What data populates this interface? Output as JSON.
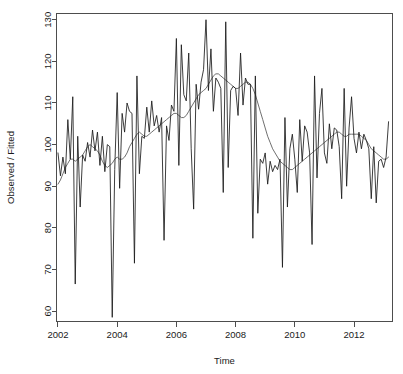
{
  "chart_data": {
    "type": "line",
    "title": "",
    "xlabel": "Time",
    "ylabel": "Observed / Fitted",
    "xlim": [
      2001.95,
      2013.3
    ],
    "ylim": [
      57.5,
      131.5
    ],
    "grid": false,
    "legend": "none",
    "xticks": [
      2002,
      2004,
      2006,
      2008,
      2010,
      2012
    ],
    "xticklabels": [
      "2002",
      "2004",
      "2006",
      "2008",
      "2010",
      "2012"
    ],
    "yticks": [
      60,
      70,
      80,
      90,
      100,
      110,
      120,
      130
    ],
    "yticklabels": [
      "60",
      "70",
      "80",
      "90",
      "100",
      "110",
      "120",
      "130"
    ],
    "x": [
      2002.0,
      2002.083,
      2002.167,
      2002.25,
      2002.333,
      2002.417,
      2002.5,
      2002.583,
      2002.667,
      2002.75,
      2002.833,
      2002.917,
      2003.0,
      2003.083,
      2003.167,
      2003.25,
      2003.333,
      2003.417,
      2003.5,
      2003.583,
      2003.667,
      2003.75,
      2003.833,
      2003.917,
      2004.0,
      2004.083,
      2004.167,
      2004.25,
      2004.333,
      2004.417,
      2004.5,
      2004.583,
      2004.667,
      2004.75,
      2004.833,
      2004.917,
      2005.0,
      2005.083,
      2005.167,
      2005.25,
      2005.333,
      2005.417,
      2005.5,
      2005.583,
      2005.667,
      2005.75,
      2005.833,
      2005.917,
      2006.0,
      2006.083,
      2006.167,
      2006.25,
      2006.333,
      2006.417,
      2006.5,
      2006.583,
      2006.667,
      2006.75,
      2006.833,
      2006.917,
      2007.0,
      2007.083,
      2007.167,
      2007.25,
      2007.333,
      2007.417,
      2007.5,
      2007.583,
      2007.667,
      2007.75,
      2007.833,
      2007.917,
      2008.0,
      2008.083,
      2008.167,
      2008.25,
      2008.333,
      2008.417,
      2008.5,
      2008.583,
      2008.667,
      2008.75,
      2008.833,
      2008.917,
      2009.0,
      2009.083,
      2009.167,
      2009.25,
      2009.333,
      2009.417,
      2009.5,
      2009.583,
      2009.667,
      2009.75,
      2009.833,
      2009.917,
      2010.0,
      2010.083,
      2010.167,
      2010.25,
      2010.333,
      2010.417,
      2010.5,
      2010.583,
      2010.667,
      2010.75,
      2010.833,
      2010.917,
      2011.0,
      2011.083,
      2011.167,
      2011.25,
      2011.333,
      2011.417,
      2011.5,
      2011.583,
      2011.667,
      2011.75,
      2011.833,
      2011.917,
      2012.0,
      2012.083,
      2012.167,
      2012.25,
      2012.333,
      2012.417,
      2012.5,
      2012.583,
      2012.667,
      2012.75,
      2012.833,
      2012.917,
      2013.0,
      2013.083,
      2013.167
    ],
    "series": [
      {
        "name": "Observed",
        "color": "#1a1a1a",
        "values": [
          98.0,
          92.5,
          97.0,
          93.0,
          106.0,
          96.5,
          111.5,
          66.5,
          102.0,
          85.0,
          97.5,
          96.0,
          100.5,
          97.0,
          103.5,
          98.5,
          103.0,
          95.0,
          102.0,
          93.5,
          100.0,
          99.5,
          58.5,
          94.0,
          112.5,
          89.5,
          107.5,
          103.0,
          110.0,
          108.0,
          107.5,
          71.5,
          116.5,
          93.0,
          102.0,
          101.5,
          109.0,
          103.0,
          110.5,
          104.5,
          107.0,
          103.0,
          106.5,
          77.0,
          104.5,
          101.0,
          109.5,
          108.0,
          125.5,
          95.0,
          124.0,
          112.0,
          110.5,
          122.0,
          99.0,
          84.5,
          114.5,
          108.5,
          115.0,
          118.0,
          130.0,
          113.0,
          123.0,
          108.0,
          116.0,
          115.0,
          113.5,
          88.5,
          129.5,
          94.5,
          113.0,
          114.0,
          113.5,
          107.0,
          122.0,
          109.5,
          116.0,
          114.5,
          114.5,
          77.5,
          116.5,
          83.5,
          96.5,
          95.5,
          98.0,
          90.5,
          96.0,
          93.5,
          95.0,
          94.0,
          96.5,
          70.5,
          106.5,
          85.0,
          99.0,
          102.5,
          96.5,
          88.5,
          106.0,
          96.0,
          104.5,
          103.0,
          98.0,
          76.0,
          116.5,
          92.0,
          107.5,
          113.5,
          98.0,
          95.5,
          105.0,
          99.0,
          104.0,
          103.5,
          99.5,
          87.0,
          113.5,
          90.0,
          104.0,
          111.5,
          101.5,
          98.0,
          103.0,
          99.0,
          102.5,
          101.0,
          99.0,
          87.0,
          99.5,
          86.0,
          96.0,
          96.5,
          94.5,
          97.0,
          105.5
        ]
      },
      {
        "name": "Fitted",
        "color": "#555555",
        "values": [
          90.5,
          91.5,
          93.0,
          94.5,
          95.5,
          96.5,
          96.5,
          96.0,
          96.5,
          97.0,
          97.5,
          98.5,
          99.5,
          100.0,
          99.5,
          99.0,
          98.5,
          97.5,
          96.0,
          95.0,
          94.5,
          95.0,
          95.5,
          96.5,
          97.0,
          96.5,
          96.5,
          97.0,
          98.0,
          99.5,
          100.5,
          101.5,
          102.5,
          103.0,
          102.5,
          102.0,
          102.0,
          102.5,
          103.0,
          103.5,
          104.0,
          104.5,
          105.0,
          105.5,
          106.0,
          106.5,
          107.0,
          107.5,
          107.5,
          107.0,
          106.5,
          106.5,
          107.0,
          108.0,
          109.0,
          110.0,
          111.0,
          112.0,
          112.5,
          113.0,
          113.5,
          114.5,
          115.5,
          116.5,
          117.0,
          117.0,
          116.5,
          116.0,
          115.5,
          115.0,
          114.5,
          114.0,
          113.5,
          113.5,
          114.0,
          114.5,
          115.0,
          115.0,
          114.5,
          113.5,
          112.0,
          110.0,
          108.0,
          106.0,
          104.0,
          102.0,
          100.5,
          99.0,
          98.0,
          97.0,
          96.0,
          95.5,
          95.0,
          94.5,
          94.0,
          94.0,
          94.5,
          95.0,
          95.5,
          96.0,
          96.5,
          97.0,
          97.5,
          98.0,
          98.5,
          99.0,
          99.5,
          100.0,
          100.5,
          101.0,
          101.5,
          102.0,
          102.5,
          103.0,
          103.0,
          102.5,
          102.0,
          102.0,
          102.5,
          102.5,
          102.5,
          102.5,
          102.5,
          102.0,
          101.5,
          101.0,
          100.0,
          99.0,
          98.5,
          98.0,
          97.5,
          97.0,
          96.5,
          96.5,
          97.0
        ]
      }
    ]
  },
  "axes": {
    "x_title": "Time",
    "y_title": "Observed / Fitted"
  }
}
